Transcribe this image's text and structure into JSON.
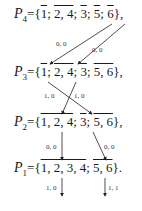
{
  "rows": [
    {
      "name": "P",
      "sub": "4",
      "content": "{1̄; 2, 4; 3̄; 5̄; 6̄},",
      "parts": [
        "={",
        "1",
        "; ",
        "2, 4",
        "; ",
        "3",
        "; ",
        "5",
        "; ",
        "6",
        "},"
      ]
    },
    {
      "name": "P",
      "sub": "3",
      "parts": [
        "={",
        "1",
        "; ",
        "2, 4",
        "; ",
        "3",
        "; ",
        "5, 6",
        "},"
      ]
    },
    {
      "name": "P",
      "sub": "2",
      "parts": [
        "={",
        "1, 2, 4",
        "; ",
        "3",
        "; ",
        "5, 6",
        "},"
      ]
    },
    {
      "name": "P",
      "sub": "1",
      "parts": [
        "={",
        "1, 2, 3, 4",
        "; ",
        "5, 6",
        "}."
      ]
    }
  ],
  "edge_labels": {
    "p4_a": "0, 0",
    "p4_b": "0, 0",
    "p3_a": "1, 0",
    "p3_b": "1, 0",
    "p2_a": "0, 0",
    "p2_b": "0, 0",
    "p1_a": "1, 0",
    "p1_b": "1, 1"
  }
}
